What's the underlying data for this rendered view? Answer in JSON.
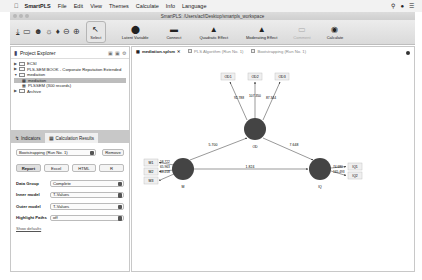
{
  "menubar": {
    "app_name": "SmartPLS",
    "items": [
      "File",
      "Edit",
      "View",
      "Themes",
      "Calculate",
      "Info",
      "Language"
    ]
  },
  "window": {
    "title": "SmartPLS: /Users/acf/Desktop/smartpls_workspace"
  },
  "toolbar": {
    "buttons": [
      {
        "label": "Select",
        "icon": "cursor-icon"
      },
      {
        "label": "Latent Variable",
        "icon": "latent-variable-icon"
      },
      {
        "label": "Connect",
        "icon": "connect-icon"
      },
      {
        "label": "Quadratic Effect",
        "icon": "quadratic-effect-icon"
      },
      {
        "label": "Moderating Effect",
        "icon": "moderating-effect-icon"
      },
      {
        "label": "Comment",
        "icon": "comment-icon"
      },
      {
        "label": "Calculate",
        "icon": "calculate-icon"
      }
    ]
  },
  "project_explorer": {
    "title": "Project Explorer",
    "items": [
      {
        "label": "ECSI",
        "level": 0,
        "expanded": false
      },
      {
        "label": "PLS-SEM BOOK - Corporate Reputation Extended",
        "level": 0,
        "expanded": false
      },
      {
        "label": "mediation",
        "level": 0,
        "expanded": true
      },
      {
        "label": "mediation",
        "level": 1,
        "selected": true
      },
      {
        "label": "PLSSEM (300 records)",
        "level": 1
      },
      {
        "label": "Archive",
        "level": 0,
        "expanded": false
      }
    ]
  },
  "calc_panel": {
    "tabs": [
      {
        "label": "Indicators",
        "active": false
      },
      {
        "label": "Calculation Results",
        "active": true
      }
    ],
    "run_select": "Bootstrapping (Run No. 1)",
    "remove_label": "Remove",
    "export_buttons": [
      "Report",
      "Excel",
      "HTML",
      "R"
    ],
    "fields": [
      {
        "label": "Data Group",
        "value": "Complete"
      },
      {
        "label": "Inner model",
        "value": "T-Values"
      },
      {
        "label": "Outer model",
        "value": "T-Values"
      },
      {
        "label": "Highlight Paths",
        "value": "off"
      }
    ],
    "show_defaults": "Show defaults"
  },
  "doc_tabs": [
    {
      "label": "mediation.splsm",
      "active": true
    },
    {
      "label": "PLS Algorithm (Run No. 1)",
      "active": false
    },
    {
      "label": "Bootstrapping (Run No. 1)",
      "active": false
    }
  ],
  "model": {
    "constructs": [
      {
        "id": "OD",
        "label": "OD"
      },
      {
        "id": "M",
        "label": "M"
      },
      {
        "id": "IQ",
        "label": "IQ"
      }
    ],
    "indicators": {
      "OD": [
        "OD1",
        "OD2",
        "OD3"
      ],
      "M": [
        "M1",
        "M2",
        "M3"
      ],
      "IQ": [
        "IQ1",
        "IQ2"
      ]
    },
    "outer_values": {
      "OD": [
        "92.788",
        "107.350",
        "87.344"
      ],
      "M": [
        "58.722",
        "65.963",
        "43.218"
      ],
      "IQ": [
        "74.680",
        "165.493"
      ]
    },
    "paths": [
      {
        "from": "M",
        "to": "OD",
        "value": "5.700"
      },
      {
        "from": "OD",
        "to": "IQ",
        "value": "7.648"
      },
      {
        "from": "M",
        "to": "IQ",
        "value": "1.824"
      }
    ]
  }
}
